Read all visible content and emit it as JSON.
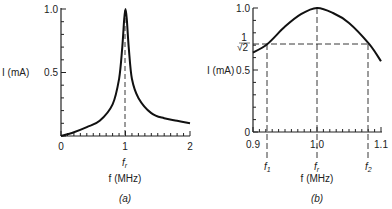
{
  "figure": {
    "panel_a": {
      "caption": "(a)",
      "ylabel": "I (mA)",
      "xlabel": "f (MHz)",
      "ytick_labels": [
        "1.0",
        "0.5"
      ],
      "xtick_labels": [
        "0",
        "1",
        "2"
      ],
      "resonance_label": "f_r"
    },
    "panel_b": {
      "caption": "(b)",
      "ylabel": "I (mA)",
      "xlabel": "f (MHz)",
      "ytick_labels": [
        "1.0",
        "0.5",
        "0"
      ],
      "half_power_label": "1/√2",
      "xtick_labels": [
        "0.9",
        "1.0",
        "1.1"
      ],
      "freq_markers": [
        "f_1",
        "f_r",
        "f_2"
      ]
    }
  },
  "chart_data": [
    {
      "type": "line",
      "title": "(a)",
      "xlabel": "f (MHz)",
      "ylabel": "I (mA)",
      "xlim": [
        0,
        2
      ],
      "ylim": [
        0,
        1.0
      ],
      "yticks": [
        0.5,
        1.0
      ],
      "xticks": [
        0,
        1,
        2
      ],
      "grid": false,
      "annotations": [
        {
          "type": "vline-dashed",
          "x": 1.0,
          "label": "f_r"
        }
      ],
      "series": [
        {
          "name": "Resonance curve",
          "x": [
            0,
            0.2,
            0.4,
            0.6,
            0.8,
            0.9,
            0.95,
            0.98,
            1.0,
            1.02,
            1.05,
            1.1,
            1.2,
            1.4,
            1.6,
            1.8,
            2.0
          ],
          "y": [
            0.0,
            0.03,
            0.07,
            0.12,
            0.25,
            0.45,
            0.7,
            0.92,
            1.0,
            0.92,
            0.7,
            0.45,
            0.3,
            0.18,
            0.14,
            0.12,
            0.1
          ]
        }
      ]
    },
    {
      "type": "line",
      "title": "(b)",
      "xlabel": "f (MHz)",
      "ylabel": "I (mA)",
      "xlim": [
        0.9,
        1.1
      ],
      "ylim": [
        0,
        1.0
      ],
      "yticks": [
        0,
        0.5,
        0.707,
        1.0
      ],
      "ytick_labels": [
        "0",
        "0.5",
        "1/√2",
        "1.0"
      ],
      "xticks": [
        0.9,
        1.0,
        1.1
      ],
      "grid": false,
      "annotations": [
        {
          "type": "hline-dashed",
          "y": 0.707,
          "label": "1/√2"
        },
        {
          "type": "vline-dashed",
          "x": 0.922,
          "label": "f_1"
        },
        {
          "type": "vline-dashed",
          "x": 1.0,
          "label": "f_r"
        },
        {
          "type": "vline-dashed",
          "x": 1.082,
          "label": "f_2"
        }
      ],
      "series": [
        {
          "name": "Resonance curve (zoomed)",
          "x": [
            0.9,
            0.922,
            0.95,
            0.975,
            1.0,
            1.025,
            1.05,
            1.082,
            1.1
          ],
          "y": [
            0.64,
            0.707,
            0.85,
            0.95,
            1.0,
            0.96,
            0.88,
            0.707,
            0.57
          ]
        }
      ]
    }
  ]
}
